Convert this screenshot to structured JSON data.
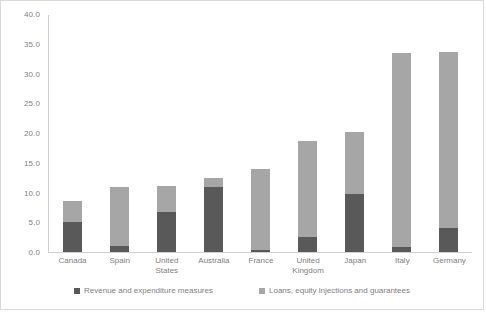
{
  "chart_data": {
    "type": "bar",
    "subtype": "stacked-vertical",
    "title": "",
    "xlabel": "",
    "ylabel": "",
    "ylim": [
      0.0,
      40.0
    ],
    "ytick_step": 5.0,
    "ytick_labels": [
      "40.0",
      "35.0",
      "30.0",
      "25.0",
      "20.0",
      "15.0",
      "10.0",
      "5.0",
      "0.0"
    ],
    "ytick_values": [
      40.0,
      35.0,
      30.0,
      25.0,
      20.0,
      15.0,
      10.0,
      5.0,
      0.0
    ],
    "grid": false,
    "legend_position": "bottom",
    "categories": [
      "Canada",
      "Spain",
      "United States",
      "Australia",
      "France",
      "United Kingdom",
      "Japan",
      "Italy",
      "Germany"
    ],
    "series": [
      {
        "name": "Revenue and expenditure measures",
        "color": "#595959",
        "values": [
          5.1,
          1.0,
          6.8,
          11.0,
          0.4,
          2.5,
          9.8,
          0.8,
          4.0
        ]
      },
      {
        "name": "Loans, equity injections and guarantees",
        "color": "#a6a6a6",
        "values": [
          3.4,
          10.0,
          4.3,
          1.5,
          13.6,
          16.2,
          10.4,
          32.7,
          29.7
        ]
      }
    ],
    "totals": [
      8.5,
      11.0,
      11.1,
      12.5,
      14.0,
      18.7,
      20.2,
      33.5,
      33.7
    ]
  },
  "legend": {
    "items": [
      {
        "label": "Revenue and expenditure measures",
        "color": "#595959"
      },
      {
        "label": "Loans, equity injections and guarantees",
        "color": "#a6a6a6"
      }
    ]
  },
  "colors": {
    "dark_series": "#595959",
    "light_series": "#a6a6a6",
    "axis": "#d0d0d0",
    "text": "#808080",
    "frame_border": "#d9d9d9",
    "background": "#ffffff"
  }
}
